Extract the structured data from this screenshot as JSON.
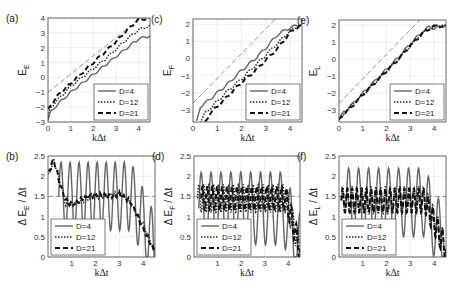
{
  "figure": {
    "legend_entries": [
      "D=4",
      "D=12",
      "D=21"
    ],
    "xlabel": "kΔt",
    "colors": {
      "D4": "#666666",
      "D12": "#222222",
      "D21": "#111111",
      "ref": "#777777",
      "grid": "#e3e3e3",
      "axis": "#444444"
    }
  },
  "chart_data": [
    {
      "id": "a",
      "panel_label": "(a)",
      "type": "line",
      "ylabel_main": "E",
      "ylabel_sub": "E",
      "xlabel": "kΔt",
      "xlim": [
        0,
        4.5
      ],
      "ylim": [
        -3,
        4
      ],
      "xticks": [
        0,
        1,
        2,
        3,
        4
      ],
      "yticks": [
        -3,
        -2,
        -1,
        0,
        1,
        2,
        3,
        4
      ],
      "grid": true,
      "legend_position": "lower right",
      "reference_line": {
        "style": "thin dashed",
        "x": [
          0,
          4.5
        ],
        "y": [
          -1,
          4.5
        ]
      },
      "series": [
        {
          "name": "D=4",
          "style": "solid",
          "x": [
            0,
            0.1,
            0.3,
            0.5,
            1,
            1.5,
            2,
            2.5,
            3,
            3.5,
            4,
            4.5
          ],
          "y": [
            -2.9,
            -2.4,
            -2.0,
            -1.7,
            -1.0,
            -0.4,
            0.2,
            0.8,
            1.4,
            2.0,
            2.6,
            2.8
          ]
        },
        {
          "name": "D=12",
          "style": "dotted",
          "x": [
            0,
            0.1,
            0.3,
            0.5,
            1,
            1.5,
            2,
            2.5,
            3,
            3.5,
            4,
            4.5
          ],
          "y": [
            -2.7,
            -2.1,
            -1.7,
            -1.4,
            -0.6,
            0.0,
            0.6,
            1.2,
            1.9,
            2.6,
            3.2,
            3.5
          ]
        },
        {
          "name": "D=21",
          "style": "dashed",
          "x": [
            0,
            0.1,
            0.3,
            0.5,
            1,
            1.5,
            2,
            2.5,
            3,
            3.5,
            4,
            4.5
          ],
          "y": [
            -2.2,
            -1.9,
            -1.5,
            -1.1,
            -0.4,
            0.3,
            1.0,
            1.7,
            2.4,
            3.2,
            3.9,
            4.0
          ]
        }
      ]
    },
    {
      "id": "c",
      "panel_label": "(c)",
      "type": "line",
      "ylabel_main": "E",
      "ylabel_sub": "F",
      "xlabel": "kΔt",
      "xlim": [
        0,
        4.5
      ],
      "ylim": [
        -3.7,
        2.3
      ],
      "xticks": [
        0,
        1,
        2,
        3,
        4
      ],
      "yticks": [
        -3,
        -2,
        -1,
        0,
        1,
        2
      ],
      "grid": true,
      "legend_position": "lower right",
      "reference_line": {
        "style": "thin dashed",
        "x": [
          0,
          3.4
        ],
        "y": [
          -2.6,
          2.3
        ]
      },
      "series": [
        {
          "name": "D=4",
          "style": "solid",
          "x": [
            0.15,
            0.3,
            0.5,
            1,
            1.5,
            2,
            2.5,
            3,
            3.5,
            4,
            4.5
          ],
          "y": [
            -3.7,
            -2.8,
            -2.6,
            -2.0,
            -1.4,
            -0.7,
            -0.1,
            0.6,
            1.4,
            1.8,
            2.0
          ]
        },
        {
          "name": "D=12",
          "style": "dotted",
          "x": [
            0.3,
            0.5,
            1,
            1.5,
            2,
            2.5,
            3,
            3.5,
            4,
            4.5
          ],
          "y": [
            -3.7,
            -3.2,
            -2.5,
            -1.8,
            -1.2,
            -0.5,
            0.2,
            0.9,
            1.6,
            2.0
          ]
        },
        {
          "name": "D=21",
          "style": "dashed",
          "x": [
            0.5,
            0.7,
            1,
            1.5,
            2,
            2.5,
            3,
            3.5,
            4,
            4.5
          ],
          "y": [
            -3.7,
            -3.2,
            -2.8,
            -2.1,
            -1.4,
            -0.8,
            -0.1,
            0.6,
            1.5,
            2.0
          ]
        }
      ]
    },
    {
      "id": "e",
      "panel_label": "(e)",
      "type": "line",
      "ylabel_main": "E",
      "ylabel_sub": "L",
      "xlabel": "kΔt",
      "xlim": [
        0,
        4.5
      ],
      "ylim": [
        -3.7,
        2.3
      ],
      "xticks": [
        0,
        1,
        2,
        3,
        4
      ],
      "yticks": [
        -3,
        -2,
        -1,
        0,
        1,
        2
      ],
      "grid": true,
      "legend_position": "lower right",
      "reference_line": {
        "style": "thin dashed",
        "x": [
          0,
          3.4
        ],
        "y": [
          -2.6,
          2.3
        ]
      },
      "series": [
        {
          "name": "D=4",
          "style": "solid",
          "x": [
            0,
            0.2,
            0.4,
            1,
            1.5,
            2,
            2.5,
            3,
            3.5,
            3.8,
            4,
            4.5
          ],
          "y": [
            -3.6,
            -3.1,
            -2.9,
            -2.0,
            -1.3,
            -0.6,
            0.1,
            0.9,
            1.6,
            1.9,
            1.8,
            2.0
          ]
        },
        {
          "name": "D=12",
          "style": "dotted",
          "x": [
            0,
            0.2,
            0.4,
            1,
            1.5,
            2,
            2.5,
            3,
            3.5,
            3.8,
            4,
            4.5
          ],
          "y": [
            -3.6,
            -3.2,
            -2.9,
            -2.1,
            -1.4,
            -0.7,
            0.0,
            0.8,
            1.5,
            1.8,
            1.9,
            2.0
          ]
        },
        {
          "name": "D=21",
          "style": "dashed",
          "x": [
            0,
            0.2,
            0.4,
            1,
            1.5,
            2,
            2.5,
            3,
            3.5,
            3.8,
            4,
            4.5
          ],
          "y": [
            -3.6,
            -3.2,
            -3.0,
            -2.1,
            -1.4,
            -0.7,
            0.0,
            0.8,
            1.5,
            1.8,
            1.9,
            2.0
          ]
        }
      ]
    },
    {
      "id": "b",
      "panel_label": "(b)",
      "type": "line",
      "ylabel_main": "Δ E",
      "ylabel_sub": "E",
      "ylabel_tail": " / Δt",
      "xlabel": "kΔt",
      "xlim": [
        0,
        4.5
      ],
      "ylim": [
        0,
        2.5
      ],
      "xticks": [
        1,
        2,
        3,
        4
      ],
      "yticks": [
        0,
        0.5,
        1,
        1.5,
        2,
        2.5
      ],
      "grid": true,
      "legend_position": "lower left",
      "reference_line": {
        "style": "thin dashed horizontal",
        "x": [
          0,
          4.5
        ],
        "y": [
          1.5,
          1.5
        ]
      },
      "series": [
        {
          "name": "D=4",
          "style": "solid",
          "oscillation": {
            "center": 1.5,
            "amplitude": 0.85,
            "period": 0.38,
            "start": 0.45,
            "decay_after": 3.5
          }
        },
        {
          "name": "D=12",
          "style": "dotted",
          "x": [
            0,
            0.25,
            0.5,
            0.75,
            1,
            1.5,
            2,
            2.5,
            3,
            3.5,
            4,
            4.5
          ],
          "y": [
            2.0,
            2.4,
            1.9,
            1.3,
            1.3,
            1.4,
            1.5,
            1.5,
            1.6,
            1.3,
            0.8,
            0.15
          ]
        },
        {
          "name": "D=21",
          "style": "dashed",
          "x": [
            0,
            0.25,
            0.5,
            0.75,
            1,
            1.5,
            2,
            2.5,
            3,
            3.5,
            4,
            4.5
          ],
          "y": [
            2.1,
            2.4,
            1.8,
            1.4,
            1.3,
            1.45,
            1.55,
            1.5,
            1.55,
            1.35,
            0.7,
            0.1
          ]
        }
      ]
    },
    {
      "id": "d",
      "panel_label": "(d)",
      "type": "line",
      "ylabel_main": "Δ E",
      "ylabel_sub": "F",
      "ylabel_tail": " / Δt",
      "xlabel": "kΔt",
      "xlim": [
        0,
        4.5
      ],
      "ylim": [
        0,
        2.5
      ],
      "xticks": [
        1,
        2,
        3,
        4
      ],
      "yticks": [
        0,
        0.5,
        1,
        1.5,
        2,
        2.5
      ],
      "grid": true,
      "legend_position": "lower left",
      "reference_line": {
        "style": "thin dashed horizontal",
        "x": [
          0,
          4.5
        ],
        "y": [
          1.5,
          1.5
        ]
      },
      "series": [
        {
          "name": "D=4",
          "style": "solid",
          "oscillation": {
            "center": 1.2,
            "amplitude": 0.9,
            "period": 0.42,
            "start": 0.2,
            "decay_after": 3.8
          }
        },
        {
          "name": "D=12",
          "style": "dotted",
          "oscillation": {
            "center": 1.45,
            "amplitude": 0.35,
            "period": 0.21,
            "start": 0.15,
            "decay_after": 3.9
          }
        },
        {
          "name": "D=21",
          "style": "dashed",
          "oscillation": {
            "center": 1.45,
            "amplitude": 0.3,
            "period": 0.21,
            "start": 0.3,
            "decay_after": 3.9
          }
        }
      ]
    },
    {
      "id": "f",
      "panel_label": "(f)",
      "type": "line",
      "ylabel_main": "Δ E",
      "ylabel_sub": "L",
      "ylabel_tail": " / Δt",
      "xlabel": "kΔt",
      "xlim": [
        0,
        4.5
      ],
      "ylim": [
        0,
        2.5
      ],
      "xticks": [
        1,
        2,
        3,
        4
      ],
      "yticks": [
        0,
        0.5,
        1,
        1.5,
        2,
        2.5
      ],
      "grid": true,
      "legend_position": "lower left",
      "reference_line": {
        "style": "thin dashed horizontal",
        "x": [
          0,
          4.5
        ],
        "y": [
          1.5,
          1.5
        ]
      },
      "series": [
        {
          "name": "D=4",
          "style": "solid",
          "oscillation": {
            "center": 1.35,
            "amplitude": 0.85,
            "period": 0.42,
            "start": 0.3,
            "decay_after": 3.6
          }
        },
        {
          "name": "D=12",
          "style": "dotted",
          "oscillation": {
            "center": 1.4,
            "amplitude": 0.35,
            "period": 0.2,
            "start": 0.1,
            "decay_after": 3.6
          }
        },
        {
          "name": "D=21",
          "style": "dashed",
          "oscillation": {
            "center": 1.4,
            "amplitude": 0.3,
            "period": 0.2,
            "start": 0.1,
            "decay_after": 3.6
          }
        }
      ]
    }
  ],
  "layout_boxes": {
    "a": [
      48,
      18,
      150,
      122
    ],
    "c": [
      193,
      19,
      302,
      122
    ],
    "e": [
      339,
      20,
      446,
      122
    ],
    "b": [
      48,
      156,
      155,
      257
    ],
    "d": [
      194,
      156,
      300,
      257
    ],
    "f": [
      339,
      156,
      446,
      257
    ]
  }
}
